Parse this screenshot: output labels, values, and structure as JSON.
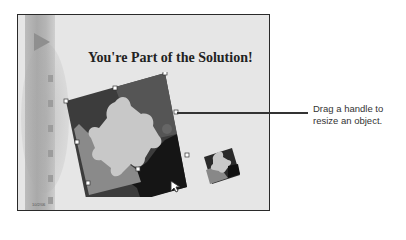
{
  "slide": {
    "title": "You're Part of the Solution!",
    "date": "10/2/06",
    "background_color": "#e6e6e6",
    "border_color": "#2a2a2a"
  },
  "film_strip": {
    "icon": "play-triangle-icon",
    "hole_count": 6
  },
  "objects": {
    "large_puzzle": {
      "selected": true,
      "pieces_colors": [
        "#3a3a3a",
        "#555555",
        "#c8c8c8",
        "#8c8c8c",
        "#161616"
      ],
      "handle_count": 8
    },
    "small_puzzle": {
      "selected": false
    }
  },
  "callout": {
    "line1": "Drag a handle to",
    "line2": "resize an object."
  },
  "cursor": {
    "icon": "arrow-cursor-icon"
  }
}
